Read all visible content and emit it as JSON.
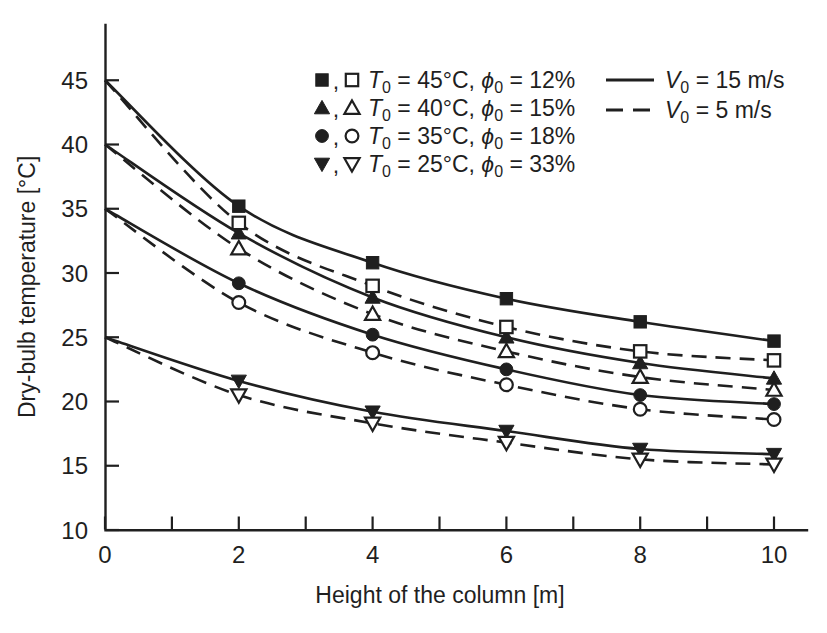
{
  "figure": {
    "background": "#ffffff",
    "ink": "#1f1f1f"
  },
  "chart_data": {
    "type": "line",
    "title": "",
    "xlabel": "Height of the column [m]",
    "ylabel": "Dry-bulb temperature [°C]",
    "xlim": [
      0,
      10.5
    ],
    "ylim": [
      10,
      49.3
    ],
    "grid": false,
    "x": [
      0,
      2,
      4,
      6,
      8,
      10
    ],
    "x_tick_marks": [
      0,
      1,
      2,
      3,
      4,
      5,
      6,
      7,
      8,
      9,
      10
    ],
    "x_tick_label_values": [
      0,
      2,
      4,
      6,
      8,
      10
    ],
    "x_tick_labels": [
      "0",
      "2",
      "4",
      "6",
      "8",
      "10"
    ],
    "y_tick_values": [
      10,
      15,
      20,
      25,
      30,
      35,
      40,
      45
    ],
    "y_tick_labels": [
      "10",
      "15",
      "20",
      "25",
      "30",
      "35",
      "40",
      "45"
    ],
    "series": [
      {
        "id": "T45-V15",
        "marker": "square",
        "marker_fill": "filled",
        "line_style": "solid",
        "t0": "45°C",
        "phi0": "12%",
        "v0": "15 m/s",
        "values": [
          45,
          35.2,
          30.8,
          28.0,
          26.2,
          24.7
        ]
      },
      {
        "id": "T45-V5",
        "marker": "square",
        "marker_fill": "open",
        "line_style": "dashed",
        "t0": "45°C",
        "phi0": "12%",
        "v0": "5 m/s",
        "values": [
          45,
          33.9,
          29.0,
          25.8,
          23.9,
          23.2
        ]
      },
      {
        "id": "T40-V15",
        "marker": "triangle-up",
        "marker_fill": "filled",
        "line_style": "solid",
        "t0": "40°C",
        "phi0": "15%",
        "v0": "15 m/s",
        "values": [
          40,
          33.1,
          28.1,
          25.0,
          23.0,
          21.8
        ]
      },
      {
        "id": "T40-V5",
        "marker": "triangle-up",
        "marker_fill": "open",
        "line_style": "dashed",
        "t0": "40°C",
        "phi0": "15%",
        "v0": "5 m/s",
        "values": [
          40,
          31.9,
          26.8,
          23.9,
          21.9,
          20.9
        ]
      },
      {
        "id": "T35-V15",
        "marker": "circle",
        "marker_fill": "filled",
        "line_style": "solid",
        "t0": "35°C",
        "phi0": "18%",
        "v0": "15 m/s",
        "values": [
          35,
          29.2,
          25.2,
          22.5,
          20.5,
          19.8
        ]
      },
      {
        "id": "T35-V5",
        "marker": "circle",
        "marker_fill": "open",
        "line_style": "dashed",
        "t0": "35°C",
        "phi0": "18%",
        "v0": "5 m/s",
        "values": [
          35,
          27.7,
          23.8,
          21.3,
          19.4,
          18.6
        ]
      },
      {
        "id": "T25-V15",
        "marker": "triangle-down",
        "marker_fill": "filled",
        "line_style": "solid",
        "t0": "25°C",
        "phi0": "33%",
        "v0": "15 m/s",
        "values": [
          25,
          21.6,
          19.2,
          17.7,
          16.3,
          15.9
        ]
      },
      {
        "id": "T25-V5",
        "marker": "triangle-down",
        "marker_fill": "open",
        "line_style": "dashed",
        "t0": "25°C",
        "phi0": "33%",
        "v0": "5 m/s",
        "values": [
          25,
          20.5,
          18.3,
          16.8,
          15.5,
          15.1
        ]
      }
    ],
    "legend_marker_groups": [
      {
        "marker": "square",
        "t0": "45°C",
        "phi0": "12%"
      },
      {
        "marker": "triangle-up",
        "t0": "40°C",
        "phi0": "15%"
      },
      {
        "marker": "circle",
        "t0": "35°C",
        "phi0": "18%"
      },
      {
        "marker": "triangle-down",
        "t0": "25°C",
        "phi0": "33%"
      }
    ],
    "legend_line_styles": [
      {
        "style": "solid",
        "v0": "15 m/s"
      },
      {
        "style": "dashed",
        "v0": "5 m/s"
      }
    ],
    "legend_symbols": {
      "temperature": "T",
      "humidity": "ϕ",
      "velocity": "V",
      "subscript": "0",
      "equals": "=",
      "separator": ","
    }
  }
}
